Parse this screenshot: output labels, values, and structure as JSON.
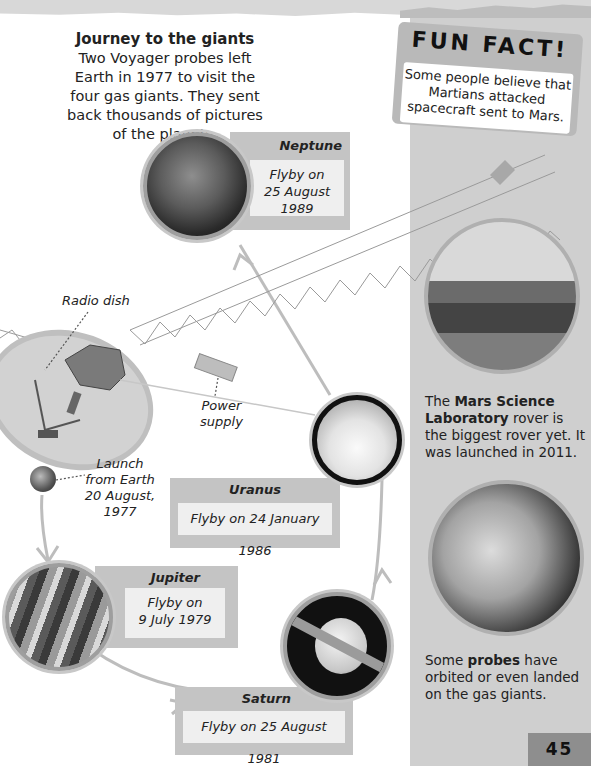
{
  "intro": {
    "title": "Journey to the giants",
    "body": "Two Voyager probes left Earth in 1977 to visit the four gas giants. They sent back thousands of pictures of the planets."
  },
  "fun_fact": {
    "heading": "FUN FACT!",
    "body": "Some people believe that Martians attacked spacecraft sent to Mars."
  },
  "diagram_labels": {
    "radio_dish": "Radio dish",
    "power_supply_line1": "Power",
    "power_supply_line2": "supply",
    "launch_line1": "Launch",
    "launch_line2": "from Earth",
    "launch_line3": "20 August, 1977"
  },
  "planets": {
    "neptune": {
      "name": "Neptune",
      "line1": "Flyby on",
      "line2": "25 August 1989"
    },
    "uranus": {
      "name": "Uranus",
      "line1": "Flyby on 24 January 1986"
    },
    "jupiter": {
      "name": "Jupiter",
      "line1": "Flyby on",
      "line2": "9 July 1979"
    },
    "saturn": {
      "name": "Saturn",
      "line1": "Flyby on 25 August 1981"
    }
  },
  "sidebar": {
    "rover_caption_pre": "The ",
    "rover_caption_bold": "Mars Science Laboratory",
    "rover_caption_post": " rover is the biggest rover yet. It was launched in 2011.",
    "probe_caption_pre": "Some ",
    "probe_caption_bold": "probes",
    "probe_caption_post": " have orbited or even landed on the gas giants."
  },
  "page_number": "45"
}
